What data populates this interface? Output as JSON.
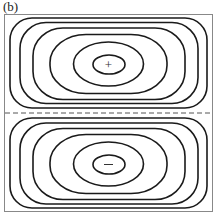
{
  "figure": {
    "panel_label": "(b)",
    "colors": {
      "streamline": "#1a1a1a",
      "frame": "#888888",
      "dashed_line": "#555555",
      "background": "#ffffff"
    },
    "cells": [
      {
        "name": "upper-cell",
        "sign_marker": "+",
        "center": [
          108,
          64
        ]
      },
      {
        "name": "lower-cell",
        "sign_marker": "−",
        "center": [
          108,
          164
        ]
      }
    ],
    "separator": {
      "style": "dashed",
      "y": 113
    }
  }
}
